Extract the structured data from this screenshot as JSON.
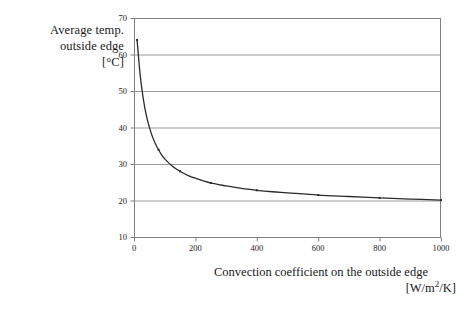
{
  "figure": {
    "background": "#ffffff",
    "axis_color": "#808080",
    "grid_color": "#9a9a9a",
    "curve_color": "#2b2b2b"
  },
  "y_axis_caption": {
    "line1": "Average temp.",
    "line2": "outside edge",
    "line3": "[°C]"
  },
  "x_axis_caption": {
    "line1": "Convection coefficient on the outside edge",
    "unit_prefix": "[W/m",
    "unit_sup": "2",
    "unit_suffix": "/K]"
  },
  "chart_data": {
    "type": "line",
    "title": "",
    "xlabel": "Convection coefficient on the outside edge [W/m2/K]",
    "ylabel": "Average temp. outside edge [°C]",
    "xlim": [
      0,
      1000
    ],
    "ylim": [
      10,
      70
    ],
    "xticks": [
      0,
      200,
      400,
      600,
      800,
      1000
    ],
    "yticks": [
      10,
      20,
      30,
      40,
      50,
      60,
      70
    ],
    "xtick_labels": [
      "0",
      "200",
      "400",
      "600",
      "800",
      "1000"
    ],
    "ytick_labels": [
      "10",
      "20",
      "30",
      "40",
      "50",
      "60",
      "70"
    ],
    "grid": "horizontal",
    "legend": "none",
    "markers": "small-dot",
    "series": [
      {
        "name": "Average temperature of the outside edge",
        "x": [
          10,
          20,
          30,
          40,
          50,
          60,
          70,
          80,
          90,
          100,
          125,
          150,
          175,
          200,
          250,
          300,
          350,
          400,
          450,
          500,
          600,
          700,
          800,
          900,
          1000
        ],
        "y": [
          64.0,
          54.5,
          48.0,
          43.4,
          40.1,
          37.5,
          35.5,
          33.9,
          32.5,
          31.4,
          29.4,
          28.0,
          26.9,
          26.1,
          24.8,
          24.0,
          23.3,
          22.8,
          22.4,
          22.1,
          21.5,
          21.1,
          20.7,
          20.4,
          20.1
        ]
      }
    ]
  },
  "geometry": {
    "plot_left": 134,
    "plot_right": 441,
    "plot_top": 18,
    "plot_bottom": 237
  }
}
